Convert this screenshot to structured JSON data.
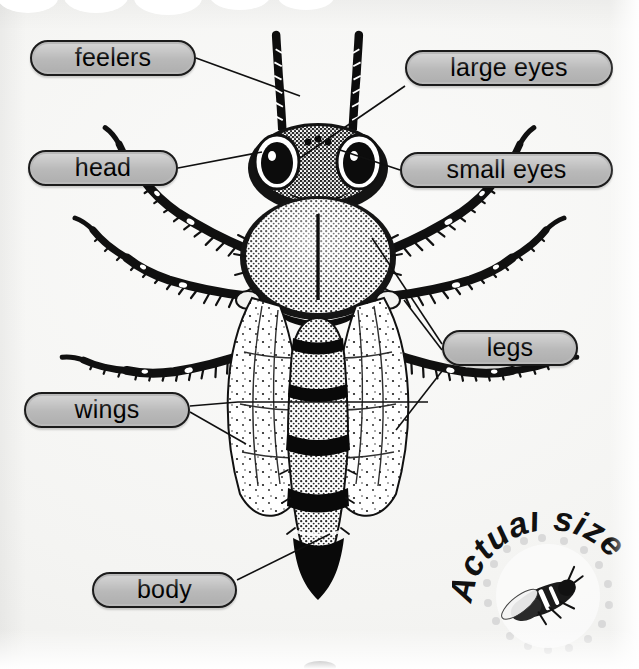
{
  "page": {
    "background_color": "#f6f6f4",
    "pill_fill_color": "#b9b9b9",
    "pill_border_color": "#1b1b1b",
    "ink_color": "#000000",
    "width": 639,
    "height": 669
  },
  "subject": {
    "name": "bee",
    "view": "dorsal",
    "illustration_style": "black-and-white stippled engraving"
  },
  "labels": [
    {
      "id": "feelers",
      "text": "feelers",
      "side": "left"
    },
    {
      "id": "head",
      "text": "head",
      "side": "left"
    },
    {
      "id": "large-eyes",
      "text": "large eyes",
      "side": "right"
    },
    {
      "id": "small-eyes",
      "text": "small eyes",
      "side": "right"
    },
    {
      "id": "legs",
      "text": "legs",
      "side": "right"
    },
    {
      "id": "wings",
      "text": "wings",
      "side": "left"
    },
    {
      "id": "body",
      "text": "body",
      "side": "left"
    }
  ],
  "badge": {
    "caption": "Actual size",
    "letters": [
      "A",
      "c",
      "t",
      "u",
      "a",
      "l",
      " ",
      "s",
      "i",
      "z",
      "e"
    ],
    "shape": "dotted-circle",
    "contains": "small bee illustration at life size"
  }
}
